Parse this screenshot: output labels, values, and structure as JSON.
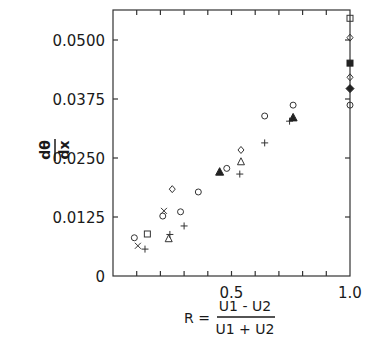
{
  "chart_data": {
    "type": "scatter",
    "title": "",
    "xlabel": "R = (U1 - U2) / (U1 + U2)",
    "xlabel_parts": {
      "lhs": "R =",
      "numerator": "U1 - U2",
      "denominator": "U1 + U2"
    },
    "ylabel": "dθ/dx",
    "ylabel_parts": {
      "numerator": "dθ",
      "denominator": "dx"
    },
    "xlim": [
      0,
      1.0
    ],
    "ylim": [
      0,
      0.0575
    ],
    "x_ticks": [
      0.1,
      0.2,
      0.3,
      0.4,
      0.5,
      0.6,
      0.7,
      0.8,
      0.9,
      1.0
    ],
    "x_tick_labels": [
      {
        "value": 0.5,
        "label": "0.5"
      },
      {
        "value": 1.0,
        "label": "1.0"
      }
    ],
    "y_ticks": [
      0,
      0.0125,
      0.025,
      0.0375,
      0.05
    ],
    "y_tick_labels": [
      {
        "value": 0,
        "label": "0"
      },
      {
        "value": 0.0125,
        "label": "0.0125"
      },
      {
        "value": 0.025,
        "label": "0.0250"
      },
      {
        "value": 0.0375,
        "label": "0.0375"
      },
      {
        "value": 0.05,
        "label": "0.0500"
      }
    ],
    "grid": false,
    "legend": "none",
    "points": [
      {
        "marker": "circle",
        "x": 0.09,
        "y": 0.0081
      },
      {
        "marker": "cross",
        "x": 0.105,
        "y": 0.0064
      },
      {
        "marker": "plus",
        "x": 0.135,
        "y": 0.0057
      },
      {
        "marker": "square",
        "x": 0.145,
        "y": 0.0089
      },
      {
        "marker": "cross",
        "x": 0.215,
        "y": 0.0138
      },
      {
        "marker": "circle",
        "x": 0.21,
        "y": 0.0127
      },
      {
        "marker": "diamond",
        "x": 0.25,
        "y": 0.0184
      },
      {
        "marker": "circle",
        "x": 0.285,
        "y": 0.0136
      },
      {
        "marker": "plus",
        "x": 0.3,
        "y": 0.0106
      },
      {
        "marker": "triangle",
        "x": 0.235,
        "y": 0.0079
      },
      {
        "marker": "plus",
        "x": 0.24,
        "y": 0.0088
      },
      {
        "marker": "circle",
        "x": 0.36,
        "y": 0.0178
      },
      {
        "marker": "triangle-filled",
        "x": 0.45,
        "y": 0.022
      },
      {
        "marker": "circle",
        "x": 0.48,
        "y": 0.0228
      },
      {
        "marker": "plus",
        "x": 0.535,
        "y": 0.0216
      },
      {
        "marker": "triangle",
        "x": 0.54,
        "y": 0.0242
      },
      {
        "marker": "diamond",
        "x": 0.54,
        "y": 0.0267
      },
      {
        "marker": "plus",
        "x": 0.64,
        "y": 0.0282
      },
      {
        "marker": "circle",
        "x": 0.64,
        "y": 0.0339
      },
      {
        "marker": "plus",
        "x": 0.745,
        "y": 0.0328
      },
      {
        "marker": "triangle-filled",
        "x": 0.76,
        "y": 0.0335
      },
      {
        "marker": "circle",
        "x": 0.76,
        "y": 0.0362
      },
      {
        "marker": "square",
        "x": 1.0,
        "y": 0.0546
      },
      {
        "marker": "diamond",
        "x": 1.0,
        "y": 0.0505
      },
      {
        "marker": "square-filled",
        "x": 1.0,
        "y": 0.0451
      },
      {
        "marker": "diamond",
        "x": 1.0,
        "y": 0.0421
      },
      {
        "marker": "diamond-filled",
        "x": 1.0,
        "y": 0.0397
      },
      {
        "marker": "circle",
        "x": 1.0,
        "y": 0.0362
      }
    ]
  }
}
